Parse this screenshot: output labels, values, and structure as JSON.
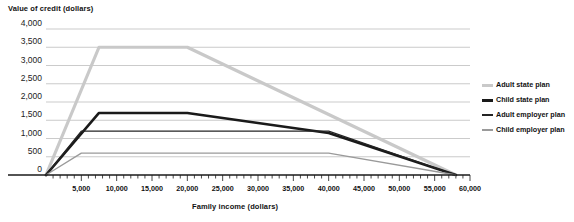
{
  "chart_data": {
    "type": "line",
    "title": "",
    "ylabel": "Value of credit (dollars)",
    "xlabel": "Family income (dollars)",
    "xlim": [
      0,
      60000
    ],
    "ylim": [
      0,
      4000
    ],
    "grid": true,
    "legend_position": "right",
    "yticks": [
      "4,000",
      "3,500",
      "3,000",
      "2,500",
      "2,000",
      "1,500",
      "1,000",
      "500",
      "0"
    ],
    "ytick_values": [
      4000,
      3500,
      3000,
      2500,
      2000,
      1500,
      1000,
      500,
      0
    ],
    "xticks": [
      "5,000",
      "10,000",
      "15,000",
      "20,000",
      "25,000",
      "30,000",
      "35,000",
      "40,000",
      "45,000",
      "50,000",
      "55,000",
      "60,000"
    ],
    "xtick_values": [
      5000,
      10000,
      15000,
      20000,
      25000,
      30000,
      35000,
      40000,
      45000,
      50000,
      55000,
      60000
    ],
    "xtick_minor_step": 1000,
    "series": [
      {
        "name": "Adult state plan",
        "color": "#c9c9c9",
        "width": 3.2,
        "x": [
          0,
          7500,
          20000,
          58000
        ],
        "values": [
          0,
          3500,
          3500,
          0
        ]
      },
      {
        "name": "Child state plan",
        "color": "#1a1a1a",
        "width": 2.6,
        "x": [
          0,
          7500,
          20000,
          40000,
          58000
        ],
        "values": [
          0,
          1700,
          1700,
          1150,
          0
        ]
      },
      {
        "name": "Adult employer plan",
        "color": "#242424",
        "width": 1.3,
        "x": [
          0,
          5000,
          40000,
          58000
        ],
        "values": [
          0,
          1200,
          1200,
          0
        ]
      },
      {
        "name": "Child employer plan",
        "color": "#9a9a9a",
        "width": 1.3,
        "x": [
          0,
          5000,
          40000,
          58000
        ],
        "values": [
          0,
          600,
          600,
          0
        ]
      }
    ]
  },
  "legend": {
    "items": [
      {
        "label": "Adult state plan",
        "color": "#c9c9c9",
        "thickness": 3
      },
      {
        "label": "Child state plan",
        "color": "#1a1a1a",
        "thickness": 3
      },
      {
        "label": "Adult employer plan",
        "color": "#242424",
        "thickness": 2
      },
      {
        "label": "Child employer plan",
        "color": "#9a9a9a",
        "thickness": 2
      }
    ]
  }
}
